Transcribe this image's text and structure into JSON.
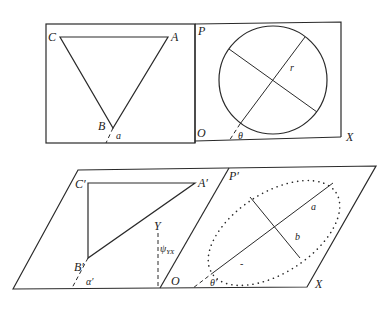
{
  "figure": {
    "top_left_panel": {
      "vertices": {
        "C": "C",
        "A": "A",
        "B": "B"
      },
      "angle_label": "a"
    },
    "top_right_panel": {
      "plane_label": "P",
      "origin_label": "O",
      "axis_label": "X",
      "radius_label": "r",
      "angle_label": "θ"
    },
    "bottom_left_panel": {
      "vertices": {
        "C": "C′",
        "A": "A′",
        "B": "B′"
      },
      "angle_label": "α′",
      "y_label": "Y",
      "psi_label": "ψ",
      "psi_subscript": "YX",
      "origin_label": "O"
    },
    "bottom_right_panel": {
      "plane_label": "P′",
      "semi_major_label": "a",
      "semi_minor_label": "b",
      "angle_label": "θ′",
      "axis_label": "X",
      "minus_mark": "-"
    },
    "colors": {
      "ink": "#2a2a2a",
      "background": "#ffffff"
    }
  }
}
